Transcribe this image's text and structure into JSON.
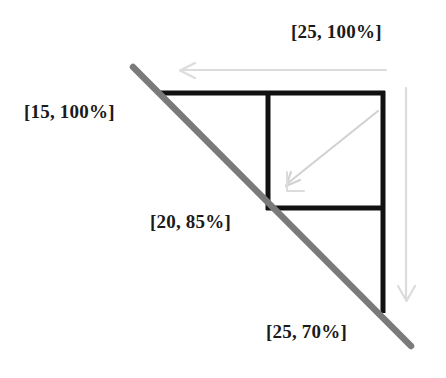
{
  "diagram": {
    "background_color": "#ffffff",
    "colors": {
      "constraint_line": "#7a7a7a",
      "structure": "#111111",
      "faint_arrow": "#d8d8d8",
      "inner_arrow": "#cfcfcf",
      "label_text": "#1a1a1a"
    },
    "labels": {
      "top_right": "[25, 100%]",
      "left": "[15, 100%]",
      "middle": "[20, 85%]",
      "bottom": "[25, 70%]"
    },
    "annotations": {
      "constraint_line_name": "trade-off-constraint-line",
      "left_arrow_name": "horizontal-reduction-arrow",
      "down_arrow_name": "vertical-reduction-arrow",
      "inner_arrow_name": "diagonal-improvement-arrow"
    }
  }
}
